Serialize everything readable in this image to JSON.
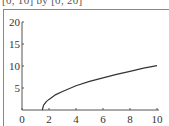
{
  "caption": "[0, 10] by [0, 20]",
  "chart_data": {
    "type": "line",
    "title": "[0, 10] by [0, 20]",
    "xlabel": "",
    "ylabel": "",
    "xlim": [
      0,
      10
    ],
    "ylim": [
      0,
      20
    ],
    "x_ticks": [
      "0",
      "2",
      "4",
      "6",
      "8",
      "10"
    ],
    "y_ticks": [
      "5",
      "10",
      "15",
      "20"
    ],
    "grid": false,
    "legend": null,
    "series": [
      {
        "name": "curve",
        "x": [
          1.5,
          1.6,
          1.8,
          2,
          2.5,
          3,
          4,
          5,
          6,
          7,
          8,
          9,
          10
        ],
        "y": [
          0,
          1.1,
          1.9,
          2.4,
          3.5,
          4.2,
          5.5,
          6.5,
          7.3,
          8.1,
          8.8,
          9.5,
          10.1
        ]
      }
    ],
    "colors": {
      "curve": "#333333",
      "axes": "#555555"
    }
  }
}
